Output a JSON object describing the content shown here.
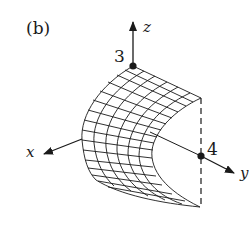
{
  "figure": {
    "panel_label": "(b)",
    "axes": {
      "x": {
        "label": "x"
      },
      "y": {
        "label": "y",
        "marked_value": "4"
      },
      "z": {
        "label": "z",
        "marked_value": "3"
      }
    },
    "surface": "quarter-cylinder mesh surface bounded by z-intercept 3 and y-extent 4",
    "colors": {
      "ink": "#1a1a1a",
      "background": "#ffffff"
    }
  }
}
